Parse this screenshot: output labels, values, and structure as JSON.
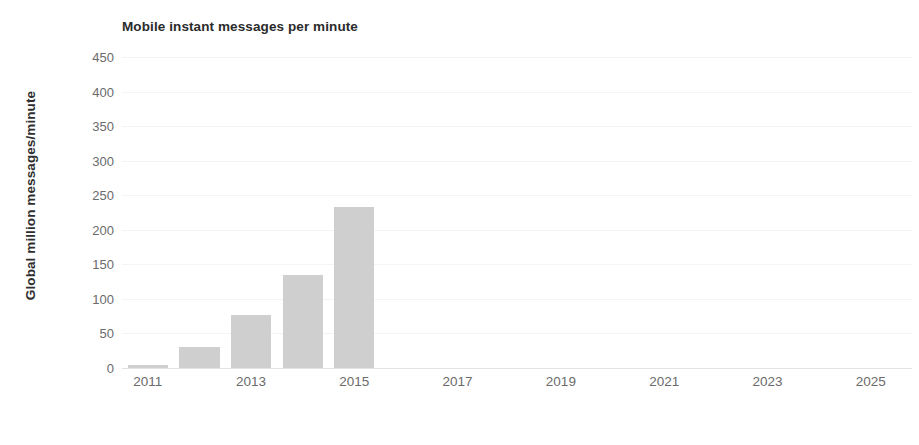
{
  "chart_data": {
    "type": "bar",
    "title": "Mobile instant messages per minute",
    "xlabel": "",
    "ylabel": "Global million messages/minute",
    "categories": [
      "2011",
      "2012",
      "2013",
      "2014",
      "2015"
    ],
    "values": [
      4,
      30,
      77,
      135,
      233
    ],
    "x": [
      2011,
      2012,
      2013,
      2014,
      2015
    ],
    "xlim": [
      2010.5,
      2025.8
    ],
    "ylim": [
      0,
      450
    ],
    "yticks": [
      0,
      50,
      100,
      150,
      200,
      250,
      300,
      350,
      400,
      450
    ],
    "ytick_labels": [
      "0",
      "50",
      "100",
      "150",
      "200",
      "250",
      "300",
      "350",
      "400",
      "450"
    ],
    "xticks": [
      2011,
      2013,
      2015,
      2017,
      2019,
      2021,
      2023,
      2025
    ],
    "xtick_labels": [
      "2011",
      "2013",
      "2015",
      "2017",
      "2019",
      "2021",
      "2023",
      "2025"
    ],
    "grid": true,
    "grid_axis": "y",
    "legend": false,
    "bar_color": "#cfcfcf",
    "grid_color": "#f4f4f4",
    "axis_color": "#e3e3e3",
    "tick_label_color": "#6b6b6b",
    "title_color": "#2b2b2b",
    "background": "#ffffff"
  }
}
